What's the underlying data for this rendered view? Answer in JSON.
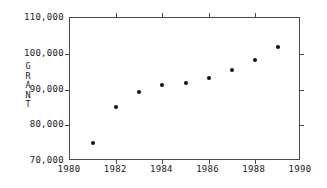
{
  "chart_data": {
    "type": "scatter",
    "title": "",
    "subtitle": "",
    "xlabel": "",
    "ylabel": "GRANT",
    "ylabel_letters": [
      "G",
      "R",
      "A",
      "N",
      "T"
    ],
    "x": [
      1981,
      1982,
      1983,
      1984,
      1985,
      1986,
      1987,
      1988,
      1989
    ],
    "values": [
      75000,
      85200,
      89200,
      91200,
      91900,
      93200,
      95400,
      98300,
      102000
    ],
    "series": [
      {
        "name": "GRANT",
        "values": [
          75000,
          85200,
          89200,
          91200,
          91900,
          93200,
          95400,
          98300,
          102000
        ]
      }
    ],
    "xlim": [
      1980,
      1990
    ],
    "ylim": [
      70000,
      110000
    ],
    "xticks": [
      1980,
      1982,
      1984,
      1986,
      1988,
      1990
    ],
    "xtick_labels": [
      "1980",
      "1982",
      "1984",
      "1986",
      "1988",
      "1990"
    ],
    "yticks": [
      70000,
      80000,
      90000,
      100000,
      110000
    ],
    "ytick_labels": [
      "70,000",
      "80,000",
      "90,000",
      "100,000",
      "110,000"
    ],
    "grid": false,
    "legend": false,
    "legend_position": "none",
    "marker": "filled-circle",
    "marker_color": "#111111",
    "frame_color": "#4a4a4a",
    "background_color": "#ffffff"
  }
}
